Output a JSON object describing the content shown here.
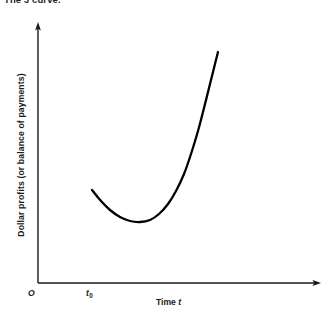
{
  "figure": {
    "caption": "The J curve.",
    "axes": {
      "y_label": "Dollar profits (or balance of payments)",
      "x_label_text": "Time",
      "x_label_var": "t",
      "origin_label": "O",
      "tick_label_var": "t",
      "tick_label_sub": "0"
    },
    "colors": {
      "background": "#ffffff",
      "axis": "#1a1a1a",
      "curve": "#000000",
      "text": "#1a1a1a"
    }
  },
  "chart_data": {
    "type": "line",
    "title": "The J curve.",
    "xlabel": "Time t",
    "ylabel": "Dollar profits (or balance of payments)",
    "grid": false,
    "legend": null,
    "axis_arrows": true,
    "origin_label": "O",
    "xticks": [
      {
        "label": "t0",
        "x_px": 92
      }
    ],
    "yticks": [],
    "xlim_px": [
      38,
      320
    ],
    "ylim_px": [
      283,
      25
    ],
    "annotations": [],
    "series": [
      {
        "name": "J curve",
        "points_px": [
          [
            92,
            190
          ],
          [
            101,
            201
          ],
          [
            110,
            210
          ],
          [
            120,
            217
          ],
          [
            130,
            221
          ],
          [
            140,
            222
          ],
          [
            150,
            220
          ],
          [
            159,
            214
          ],
          [
            168,
            204
          ],
          [
            176,
            191
          ],
          [
            184,
            174
          ],
          [
            191,
            154
          ],
          [
            198,
            131
          ],
          [
            204,
            108
          ],
          [
            210,
            84
          ],
          [
            214,
            68
          ],
          [
            218,
            52
          ]
        ],
        "shape_description": "declines from start at t0, reaches a minimum, then rises steeply above the starting level"
      }
    ]
  }
}
